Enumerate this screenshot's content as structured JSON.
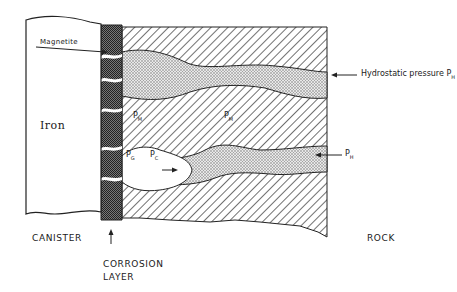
{
  "diagram": {
    "type": "cross-section",
    "regions": [
      {
        "name": "canister",
        "label": "Iron"
      },
      {
        "name": "corrosion-layer",
        "label": "Magnetite"
      },
      {
        "name": "rock"
      }
    ],
    "labels": {
      "magnetite": "Magnetite",
      "iron": "Iron",
      "hydrostatic": "Hydrostatic pressure P",
      "hydrostatic_sub": "H",
      "ph": "P",
      "ph_sub": "H",
      "pm1": "P",
      "pm1_sub": "M",
      "pm2": "P",
      "pm2_sub": "M",
      "pg": "P",
      "pg_sub": "G",
      "pc": "P",
      "pc_sub": "C"
    },
    "captions": {
      "canister": "CANISTER",
      "corrosion_line1": "CORROSION",
      "corrosion_line2": "LAYER",
      "rock": "ROCK"
    },
    "colors": {
      "ink": "#1a1a1a",
      "background": "#ffffff",
      "magnetite_fill": "#555555",
      "water_fill": "#cfcfcf"
    }
  }
}
